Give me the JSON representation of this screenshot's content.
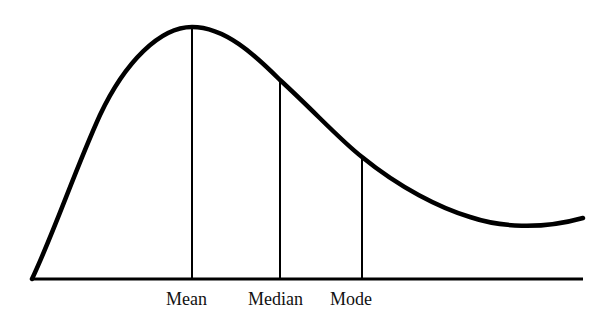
{
  "diagram": {
    "type": "skewed-distribution",
    "line_color": "#000000",
    "background": "#ffffff",
    "baseline": {
      "x1": 32,
      "x2": 583,
      "y": 279
    },
    "curve_path": "M 32 279 C 55 230, 75 170, 100 115 C 125 62, 160 27, 192 27 C 225 27, 255 55, 280 80 C 315 112, 340 140, 362 157 C 400 188, 440 208, 470 217 C 500 227, 540 230, 583 218",
    "markers": [
      {
        "name": "mean",
        "label": "Mean",
        "x": 192,
        "y_top": 28,
        "label_x": 166,
        "label_y": 290
      },
      {
        "name": "median",
        "label": "Median",
        "x": 280,
        "y_top": 80,
        "label_x": 248,
        "label_y": 290
      },
      {
        "name": "mode",
        "label": "Mode",
        "x": 362,
        "y_top": 157,
        "label_x": 330,
        "label_y": 290
      }
    ]
  }
}
